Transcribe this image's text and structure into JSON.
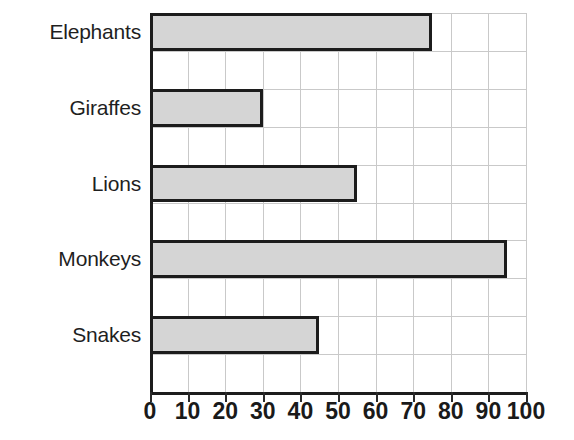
{
  "chart_data": {
    "type": "bar",
    "orientation": "horizontal",
    "title": "",
    "subtitle": "",
    "xlabel": "",
    "ylabel": "",
    "categories": [
      "Elephants",
      "Giraffes",
      "Lions",
      "Monkeys",
      "Snakes"
    ],
    "values": [
      75,
      30,
      55,
      95,
      45
    ],
    "xlim": [
      0,
      100
    ],
    "xticks": [
      0,
      10,
      20,
      30,
      40,
      50,
      60,
      70,
      80,
      90,
      100
    ],
    "xtick_labels": [
      "0",
      "10",
      "20",
      "30",
      "40",
      "50",
      "60",
      "70",
      "80",
      "90",
      "100"
    ],
    "grid": true,
    "legend": false,
    "legend_position": "none",
    "bar_fill_color": "#d5d5d5",
    "bar_edge_color": "#1c1c1c",
    "gridline_color": "#c9c9c9",
    "background_color": "#ffffff",
    "annotations": []
  },
  "axes": {
    "x": {
      "ticks": [
        {
          "value": 0,
          "label": "0"
        },
        {
          "value": 10,
          "label": "10"
        },
        {
          "value": 20,
          "label": "20"
        },
        {
          "value": 30,
          "label": "30"
        },
        {
          "value": 40,
          "label": "40"
        },
        {
          "value": 50,
          "label": "50"
        },
        {
          "value": 60,
          "label": "60"
        },
        {
          "value": 70,
          "label": "70"
        },
        {
          "value": 80,
          "label": "80"
        },
        {
          "value": 90,
          "label": "90"
        },
        {
          "value": 100,
          "label": "100"
        }
      ]
    },
    "y": {
      "categories": [
        {
          "label": "Elephants",
          "value": 75
        },
        {
          "label": "Giraffes",
          "value": 30
        },
        {
          "label": "Lions",
          "value": 55
        },
        {
          "label": "Monkeys",
          "value": 95
        },
        {
          "label": "Snakes",
          "value": 45
        }
      ]
    }
  }
}
